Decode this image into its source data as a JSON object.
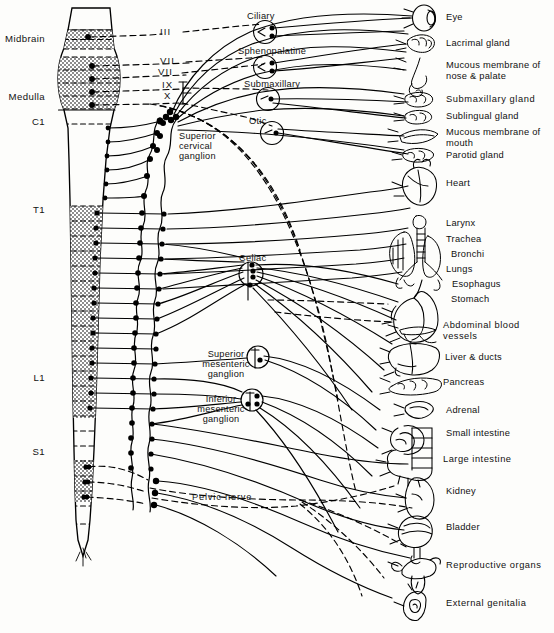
{
  "figure": {
    "type": "anatomical-schematic",
    "background_color": "#fdfdfb",
    "line_color": "#000000",
    "shade_color": "#9a9a9a"
  },
  "cns": {
    "regions": [
      {
        "name": "midbrain",
        "label": "Midbrain",
        "x": 45,
        "y": 40
      },
      {
        "name": "medulla",
        "label": "Medulla",
        "x": 45,
        "y": 98
      },
      {
        "name": "c1",
        "label": "C1",
        "x": 45,
        "y": 123
      }
    ],
    "spinal_segments": [
      {
        "name": "t1",
        "label": "T1",
        "x": 45,
        "y": 211
      },
      {
        "name": "l1",
        "label": "L1",
        "x": 45,
        "y": 379
      },
      {
        "name": "s1",
        "label": "S1",
        "x": 45,
        "y": 453
      }
    ]
  },
  "cranial_nerves": [
    {
      "name": "cn3",
      "label": "III",
      "x": 167,
      "y": 32
    },
    {
      "name": "cn7a",
      "label": "VII",
      "x": 167,
      "y": 61
    },
    {
      "name": "cn7b",
      "label": "VII",
      "x": 165,
      "y": 72
    },
    {
      "name": "cn9",
      "label": "IX",
      "x": 168,
      "y": 86
    },
    {
      "name": "cn10",
      "label": "X",
      "x": 170,
      "y": 97
    }
  ],
  "parasympathetic_ganglia": [
    {
      "name": "ciliary-ganglion",
      "label": "Ciliary",
      "x": 274,
      "y": 17
    },
    {
      "name": "sphenopalatine-ganglion",
      "label": "Sphenopalatine",
      "x": 240,
      "y": 52
    },
    {
      "name": "submaxillary-ganglion",
      "label": "Submaxillary",
      "x": 261,
      "y": 85
    },
    {
      "name": "otic-ganglion",
      "label": "Otic",
      "x": 250,
      "y": 122
    }
  ],
  "sympathetic_ganglia": [
    {
      "name": "superior-cervical-ganglion",
      "label": "Superior\ncervical\nganglion",
      "x": 181,
      "y": 137
    },
    {
      "name": "celiac-ganglion",
      "label": "Celiac",
      "x": 240,
      "y": 259
    },
    {
      "name": "superior-mesenteric-ganglion",
      "label": "Superior\nmesenteric\nganglion",
      "x": 204,
      "y": 355
    },
    {
      "name": "inferior-mesenteric-ganglion",
      "label": "Inferior\nmesenteric\nganglion",
      "x": 202,
      "y": 400
    }
  ],
  "nerves": [
    {
      "name": "pelvic-nerve",
      "label": "Pelvic nerve",
      "x": 196,
      "y": 498
    }
  ],
  "target_organs": [
    {
      "name": "eye",
      "label": "Eye",
      "x": 447,
      "y": 17
    },
    {
      "name": "lacrimal-gland",
      "label": "Lacrimal gland",
      "x": 447,
      "y": 44
    },
    {
      "name": "mucous-membrane-nose",
      "label": "Mucous membrane of\nnose & palate",
      "x": 447,
      "y": 66
    },
    {
      "name": "submaxillary-gland",
      "label": "Submaxillary gland",
      "x": 447,
      "y": 100
    },
    {
      "name": "sublingual-gland",
      "label": "Sublingual gland",
      "x": 447,
      "y": 117
    },
    {
      "name": "mucous-membrane-mouth",
      "label": "Mucous membrane of\nmouth",
      "x": 447,
      "y": 133
    },
    {
      "name": "parotid-gland",
      "label": "Parotid gland",
      "x": 447,
      "y": 156
    },
    {
      "name": "heart",
      "label": "Heart",
      "x": 447,
      "y": 184
    },
    {
      "name": "larynx",
      "label": "Larynx",
      "x": 447,
      "y": 224
    },
    {
      "name": "trachea",
      "label": "Trachea",
      "x": 447,
      "y": 240
    },
    {
      "name": "bronchi",
      "label": "Bronchi",
      "x": 452,
      "y": 255
    },
    {
      "name": "lungs",
      "label": "Lungs",
      "x": 447,
      "y": 270
    },
    {
      "name": "esophagus",
      "label": "Esophagus",
      "x": 453,
      "y": 285
    },
    {
      "name": "stomach",
      "label": "Stomach",
      "x": 452,
      "y": 300
    },
    {
      "name": "abdominal-blood-vessels",
      "label": "Abdominal blood\nvessels",
      "x": 444,
      "y": 326
    },
    {
      "name": "liver-and-ducts",
      "label": "Liver & ducts",
      "x": 446,
      "y": 358
    },
    {
      "name": "pancreas",
      "label": "Pancreas",
      "x": 444,
      "y": 383
    },
    {
      "name": "adrenal",
      "label": "Adrenal",
      "x": 447,
      "y": 411
    },
    {
      "name": "small-intestine",
      "label": "Small intestine",
      "x": 447,
      "y": 434
    },
    {
      "name": "large-intestine",
      "label": "Large intestine",
      "x": 444,
      "y": 460
    },
    {
      "name": "kidney",
      "label": "Kidney",
      "x": 447,
      "y": 492
    },
    {
      "name": "bladder",
      "label": "Bladder",
      "x": 447,
      "y": 528
    },
    {
      "name": "reproductive-organs",
      "label": "Reproductive organs",
      "x": 447,
      "y": 566
    },
    {
      "name": "external-genitalia",
      "label": "External genitalia",
      "x": 447,
      "y": 604
    }
  ]
}
